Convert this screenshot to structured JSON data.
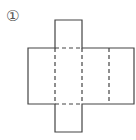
{
  "figure": {
    "label": "①",
    "line_color": "#444444",
    "main_rect": {
      "x": 28,
      "y": 48,
      "w": 106,
      "h": 56
    },
    "top_flap": {
      "x": 55,
      "y": 20,
      "w": 27,
      "h": 28
    },
    "bottom_flap": {
      "x": 55,
      "y": 104,
      "w": 27,
      "h": 28
    },
    "fold_lines_vertical_x": [
      55,
      82,
      109
    ],
    "fold_lines_horizontal": [
      {
        "y": 48,
        "x1": 55,
        "x2": 82
      },
      {
        "y": 104,
        "x1": 55,
        "x2": 82
      }
    ]
  }
}
